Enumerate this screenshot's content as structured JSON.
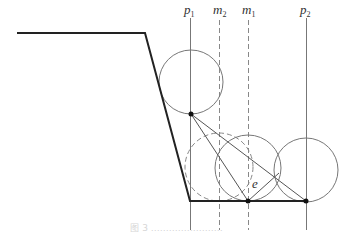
{
  "diagram": {
    "labels": {
      "p1": {
        "base": "p",
        "sub": "1"
      },
      "m2": {
        "base": "m",
        "sub": "2"
      },
      "m1": {
        "base": "m",
        "sub": "1"
      },
      "p2": {
        "base": "p",
        "sub": "2"
      },
      "e": "e"
    },
    "caption": "图 3   ……………………"
  }
}
